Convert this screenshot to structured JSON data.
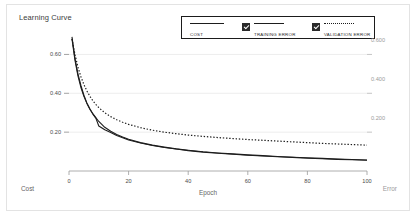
{
  "card": {
    "title": "Learning Curve"
  },
  "legend": {
    "items": [
      {
        "label": "COST",
        "marker": "solid-line",
        "checkbox": false
      },
      {
        "label": "TRAINING ERROR",
        "marker": "solid-line",
        "checkbox": true
      },
      {
        "label": "VALIDATION ERROR",
        "marker": "dotted-line",
        "checkbox": true
      }
    ]
  },
  "axes": {
    "left_label": "Cost",
    "center_label": "Epoch",
    "right_label": "Error",
    "left_ticks": [
      "0.60",
      "0.40",
      "0.20"
    ],
    "right_ticks": [
      "0.600",
      "0.400",
      "0.200"
    ],
    "x_ticks": [
      "0",
      "20",
      "40",
      "60",
      "80",
      "100"
    ]
  },
  "colors": {
    "line": "#1d1d1d",
    "grid": "#ededed",
    "border": "#e3e3e3",
    "right_axis_text": "#9b9b9b"
  },
  "chart_data": {
    "type": "line",
    "title": "Learning Curve",
    "xlabel": "Epoch",
    "ylabel": "Cost",
    "y2label": "Error",
    "xlim": [
      0,
      100
    ],
    "ylim": [
      0,
      0.7
    ],
    "y2lim": [
      0,
      0.7
    ],
    "grid": true,
    "legend_position": "top-center",
    "x": [
      1,
      2,
      3,
      4,
      5,
      6,
      7,
      8,
      9,
      10,
      12,
      14,
      16,
      18,
      20,
      24,
      28,
      32,
      36,
      40,
      45,
      50,
      55,
      60,
      65,
      70,
      75,
      80,
      85,
      90,
      95,
      100
    ],
    "series": [
      {
        "name": "COST",
        "style": "solid",
        "values": [
          0.69,
          0.58,
          0.5,
          0.44,
          0.39,
          0.35,
          0.32,
          0.295,
          0.275,
          0.255,
          0.225,
          0.205,
          0.188,
          0.175,
          0.163,
          0.146,
          0.133,
          0.123,
          0.114,
          0.107,
          0.099,
          0.093,
          0.088,
          0.083,
          0.079,
          0.075,
          0.071,
          0.068,
          0.065,
          0.062,
          0.059,
          0.057
        ]
      },
      {
        "name": "TRAINING ERROR",
        "style": "solid",
        "values": [
          0.68,
          0.57,
          0.49,
          0.43,
          0.385,
          0.348,
          0.318,
          0.293,
          0.272,
          0.232,
          0.212,
          0.198,
          0.183,
          0.171,
          0.16,
          0.144,
          0.131,
          0.121,
          0.113,
          0.105,
          0.097,
          0.091,
          0.086,
          0.081,
          0.077,
          0.073,
          0.07,
          0.066,
          0.063,
          0.06,
          0.058,
          0.055
        ]
      },
      {
        "name": "VALIDATION ERROR",
        "style": "dotted",
        "values": [
          0.68,
          0.6,
          0.535,
          0.485,
          0.445,
          0.412,
          0.385,
          0.362,
          0.343,
          0.326,
          0.3,
          0.28,
          0.264,
          0.251,
          0.24,
          0.223,
          0.21,
          0.2,
          0.192,
          0.185,
          0.178,
          0.172,
          0.167,
          0.162,
          0.158,
          0.154,
          0.15,
          0.146,
          0.142,
          0.139,
          0.136,
          0.133
        ]
      }
    ]
  }
}
